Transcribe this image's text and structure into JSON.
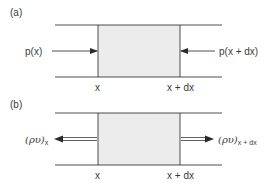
{
  "colors": {
    "line": "#3a3a3a",
    "fill": "#ececec",
    "background": "#ffffff"
  },
  "panel_a": {
    "label": "(a)",
    "left_force": "p(x)",
    "right_force": "p(x + dx)",
    "x_left": "x",
    "x_right": "x + dx"
  },
  "panel_b": {
    "label": "(b)",
    "left_flux": "(ρυ)",
    "left_flux_sub": "x",
    "right_flux": "(ρυ)",
    "right_flux_sub": "x + dx",
    "x_left": "x",
    "x_right": "x + dx"
  }
}
